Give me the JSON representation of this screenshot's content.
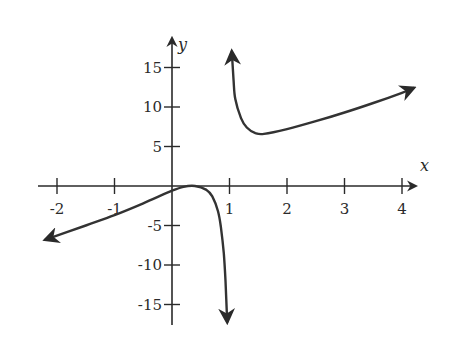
{
  "chart_data": {
    "type": "line",
    "title": "",
    "xlabel": "x",
    "ylabel": "y",
    "xlim": [
      -2.2,
      4.2
    ],
    "ylim": [
      -17.5,
      18
    ],
    "grid": false,
    "legend": null,
    "x_ticks": [
      -2,
      -1,
      1,
      2,
      3,
      4
    ],
    "x_tick_labels": [
      "-2",
      "-1",
      "1",
      "2",
      "3",
      "4"
    ],
    "y_ticks": [
      15,
      10,
      5,
      -5,
      -10,
      -15
    ],
    "y_tick_labels": [
      "15",
      "10",
      "5",
      "-5",
      "-10",
      "-15"
    ],
    "vertical_asymptote": 1,
    "series": [
      {
        "name": "left-branch",
        "arrows": [
          "start",
          "end"
        ],
        "points": [
          [
            -2.2,
            -6.8
          ],
          [
            -1.5,
            -5.0
          ],
          [
            -1.0,
            -3.7
          ],
          [
            -0.5,
            -2.2
          ],
          [
            0.0,
            -0.6
          ],
          [
            0.2,
            -0.1
          ],
          [
            0.4,
            0.0
          ],
          [
            0.6,
            -0.5
          ],
          [
            0.7,
            -1.3
          ],
          [
            0.8,
            -3.2
          ],
          [
            0.85,
            -5.2
          ],
          [
            0.9,
            -8.5
          ],
          [
            0.93,
            -12.0
          ],
          [
            0.96,
            -17.2
          ]
        ]
      },
      {
        "name": "right-branch",
        "arrows": [
          "start",
          "end"
        ],
        "points": [
          [
            1.04,
            17.0
          ],
          [
            1.07,
            13.5
          ],
          [
            1.1,
            11.0
          ],
          [
            1.2,
            8.6
          ],
          [
            1.3,
            7.4
          ],
          [
            1.45,
            6.7
          ],
          [
            1.6,
            6.6
          ],
          [
            2.0,
            7.2
          ],
          [
            2.5,
            8.2
          ],
          [
            3.0,
            9.3
          ],
          [
            3.5,
            10.5
          ],
          [
            4.0,
            11.8
          ],
          [
            4.2,
            12.4
          ]
        ]
      }
    ]
  },
  "axes": {
    "x_label": "x",
    "y_label": "y"
  }
}
